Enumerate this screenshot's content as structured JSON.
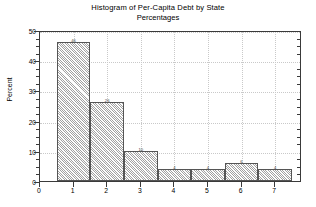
{
  "chart_data": {
    "type": "bar",
    "title": "Histogram of Per-Capita Debt by State",
    "subtitle": "Percentages",
    "xlabel": "",
    "ylabel": "Percent",
    "categories": [
      "1",
      "2",
      "3",
      "4",
      "5",
      "6",
      "7"
    ],
    "values": [
      46,
      26,
      10,
      4,
      4,
      6,
      4
    ],
    "bar_labels": [
      "46",
      "26",
      "10",
      "4",
      "4",
      "6",
      "4"
    ],
    "bin_edges": [
      0.5,
      1.5,
      2.5,
      3.5,
      4.5,
      5.5,
      6.5,
      7.5
    ],
    "xlim": [
      0,
      7.8
    ],
    "ylim": [
      0,
      50
    ],
    "xticks": [
      "0",
      "1",
      "2",
      "3",
      "4",
      "5",
      "6",
      "7"
    ],
    "xtick_values": [
      0,
      1,
      2,
      3,
      4,
      5,
      6,
      7
    ],
    "yticks": [
      "0",
      "10",
      "20",
      "30",
      "40",
      "50"
    ],
    "ytick_values": [
      0,
      10,
      20,
      30,
      40,
      50
    ],
    "grid": true,
    "grid_style": "dotted",
    "legend": null,
    "colors": {
      "bar_fill": "#d4d4d4",
      "bar_edge": "#555555",
      "grid": "#c9c9c9",
      "axis": "#3a3a3a",
      "text": "#000000",
      "background": "#ffffff"
    }
  }
}
